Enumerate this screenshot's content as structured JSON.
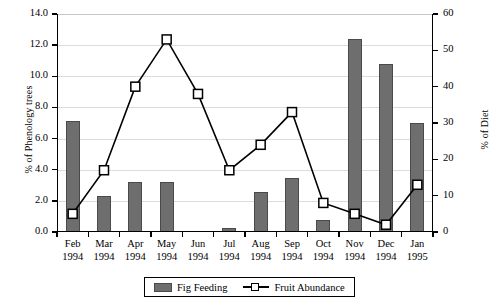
{
  "chart_data": {
    "type": "bar",
    "title": "",
    "xlabel": "",
    "ylabel": "% of Phenology trees",
    "y2label": "% of Diet",
    "ylim": [
      0,
      14
    ],
    "y2lim": [
      0,
      60
    ],
    "ytick_step": 2,
    "y2tick_step": 10,
    "grid": true,
    "legend_position": "bottom-center",
    "categories": [
      "Feb 1994",
      "Mar 1994",
      "Apr 1994",
      "May 1994",
      "Jun 1994",
      "Jul 1994",
      "Aug 1994",
      "Sep 1994",
      "Oct 1994",
      "Nov 1994",
      "Dec 1994",
      "Jan 1995"
    ],
    "category_months": [
      "Feb",
      "Mar",
      "Apr",
      "May",
      "Jun",
      "Jul",
      "Aug",
      "Sep",
      "Oct",
      "Nov",
      "Dec",
      "Jan"
    ],
    "category_years": [
      "1994",
      "1994",
      "1994",
      "1994",
      "1994",
      "1994",
      "1994",
      "1994",
      "1994",
      "1994",
      "1994",
      "1995"
    ],
    "ytick_labels": [
      "0.0",
      "2.0",
      "4.0",
      "6.0",
      "8.0",
      "10.0",
      "12.0",
      "14.0"
    ],
    "ytick_values": [
      0,
      2,
      4,
      6,
      8,
      10,
      12,
      14
    ],
    "y2tick_labels": [
      "0",
      "10",
      "20",
      "30",
      "40",
      "50",
      "60"
    ],
    "y2tick_values": [
      0,
      10,
      20,
      30,
      40,
      50,
      60
    ],
    "series": [
      {
        "name": "Fig Feeding",
        "chart_type": "bar",
        "axis": "left",
        "color": "#6e6e6e",
        "values": [
          7.15,
          2.3,
          3.2,
          3.2,
          0,
          0.25,
          2.6,
          3.5,
          0.8,
          12.4,
          10.8,
          7.0
        ]
      },
      {
        "name": "Fruit Abundance",
        "chart_type": "line",
        "axis": "right",
        "color": "#000000",
        "marker": "open-square",
        "values": [
          5,
          17,
          40,
          53,
          38,
          17,
          24,
          33,
          8,
          5,
          2,
          13
        ]
      }
    ]
  },
  "legend": {
    "items": [
      {
        "label": "Fig Feeding",
        "swatch": "bar-swatch"
      },
      {
        "label": "Fruit Abundance",
        "swatch": "line-marker-swatch"
      }
    ]
  }
}
